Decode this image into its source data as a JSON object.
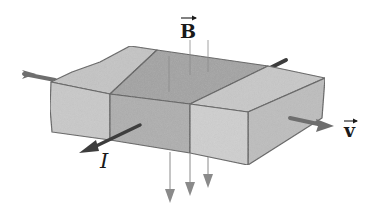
{
  "diagram": {
    "labels": {
      "magnetic_field": "B",
      "velocity": "v",
      "current": "I"
    },
    "colors": {
      "face_left_front": "#c9c9c9",
      "face_middle_front": "#aeaeae",
      "face_right_front": "#cfcfcf",
      "top_left": "#c4c4c4",
      "top_middle": "#a3a3a3",
      "top_right": "#c8c8c8",
      "side_right": "#bdbdbd",
      "edge": "#5f5f5f",
      "arrow_dark": "#3d3d3d",
      "arrow_field": "#8a8a8a"
    },
    "segments": [
      "left-segment",
      "middle-segment",
      "right-segment"
    ],
    "field_arrows_count": 3
  }
}
